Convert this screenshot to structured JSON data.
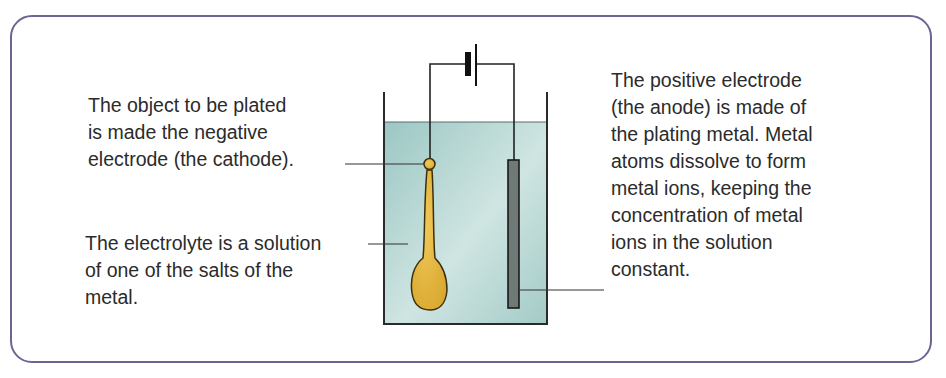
{
  "diagram": {
    "labels": {
      "cathode": "The object to be plated\nis made the negative\nelectrode (the cathode).",
      "electrolyte": "The electrolyte is a solution\nof one of the salts of the\nmetal.",
      "anode": "The positive electrode\n(the anode) is made of\nthe plating metal. Metal\natoms dissolve to form\nmetal ions, keeping the\nconcentration of metal\nions in the solution\nconstant."
    },
    "components": [
      "battery-cell",
      "beaker",
      "electrolyte-solution",
      "cathode-spoon",
      "anode-plate",
      "wires"
    ],
    "colors": {
      "frame": "#6a6592",
      "solution": "#a9cdca",
      "spoon": "#e0b440",
      "anode": "#6f7a76",
      "line": "#222222"
    }
  }
}
